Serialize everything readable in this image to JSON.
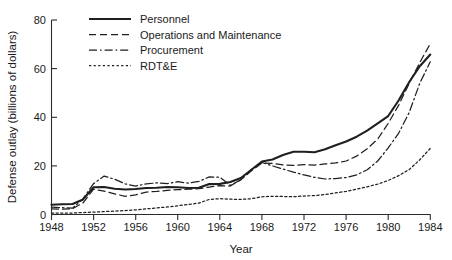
{
  "chart_data": {
    "type": "line",
    "title": "",
    "xlabel": "Year",
    "ylabel": "Defense outlay (billions of dollars)",
    "xlim": [
      1948,
      1984
    ],
    "ylim": [
      0,
      80
    ],
    "xticks": [
      1948,
      1952,
      1956,
      1960,
      1964,
      1968,
      1972,
      1976,
      1980,
      1984
    ],
    "yticks": [
      0,
      20,
      40,
      60,
      80
    ],
    "xtick_labels": [
      "1948",
      "1952",
      "1956",
      "1960",
      "1964",
      "1968",
      "1972",
      "1976",
      "1980",
      "1984"
    ],
    "ytick_labels": [
      "0",
      "20",
      "40",
      "60",
      "80"
    ],
    "grid": false,
    "legend_position": "upper-left-inside",
    "x": [
      1948,
      1949,
      1950,
      1951,
      1952,
      1953,
      1954,
      1955,
      1956,
      1957,
      1958,
      1959,
      1960,
      1961,
      1962,
      1963,
      1964,
      1965,
      1966,
      1967,
      1968,
      1969,
      1970,
      1971,
      1972,
      1973,
      1974,
      1975,
      1976,
      1977,
      1978,
      1979,
      1980,
      1981,
      1982,
      1983,
      1984
    ],
    "series": [
      {
        "name": "Personnel",
        "style": "solid",
        "values": [
          4.0,
          4.2,
          4.3,
          6.2,
          11.2,
          11.3,
          10.6,
          10.3,
          10.5,
          10.9,
          11.0,
          11.3,
          11.2,
          10.9,
          11.0,
          12.5,
          12.6,
          13.4,
          15.0,
          18.4,
          21.8,
          22.6,
          24.5,
          25.8,
          25.8,
          25.6,
          26.8,
          28.5,
          30.0,
          32.0,
          34.5,
          37.5,
          40.5,
          47.0,
          54.5,
          61.0,
          65.8
        ]
      },
      {
        "name": "Operations and Maintenance",
        "style": "dashed",
        "values": [
          2.3,
          2.2,
          2.4,
          4.8,
          10.4,
          9.6,
          8.5,
          7.5,
          8.1,
          9.2,
          9.5,
          9.9,
          10.2,
          10.4,
          10.6,
          11.3,
          11.9,
          11.7,
          14.3,
          18.0,
          21.2,
          21.0,
          20.4,
          20.2,
          20.5,
          20.3,
          20.8,
          21.2,
          22.0,
          24.0,
          27.0,
          31.0,
          37.5,
          45.0,
          54.0,
          62.5,
          70.3
        ]
      },
      {
        "name": "Procurement",
        "style": "dash-dot",
        "values": [
          3.0,
          2.8,
          2.6,
          6.5,
          12.7,
          15.8,
          14.5,
          12.6,
          11.7,
          12.6,
          13.0,
          12.7,
          13.5,
          12.9,
          13.6,
          15.5,
          15.3,
          12.0,
          14.3,
          18.5,
          21.4,
          20.0,
          18.7,
          17.4,
          16.3,
          15.3,
          14.6,
          14.8,
          15.2,
          16.3,
          18.4,
          22.0,
          27.4,
          33.5,
          42.0,
          54.0,
          62.8
        ]
      },
      {
        "name": "RDT&E",
        "style": "dotted",
        "values": [
          0.6,
          0.6,
          0.6,
          0.8,
          1.0,
          1.2,
          1.4,
          1.6,
          1.9,
          2.3,
          2.7,
          3.1,
          3.6,
          4.1,
          4.7,
          6.2,
          6.5,
          6.3,
          6.2,
          6.5,
          7.3,
          7.5,
          7.4,
          7.3,
          7.6,
          7.8,
          8.2,
          8.9,
          9.5,
          10.4,
          11.4,
          12.5,
          14.0,
          16.0,
          18.5,
          22.5,
          27.2
        ]
      }
    ],
    "legend_entries": [
      "Personnel",
      "Operations and Maintenance",
      "Procurement",
      "RDT&E"
    ],
    "colors": {
      "line": "#1f1f1f",
      "axis": "#2b2b2b",
      "background": "#ffffff"
    }
  }
}
